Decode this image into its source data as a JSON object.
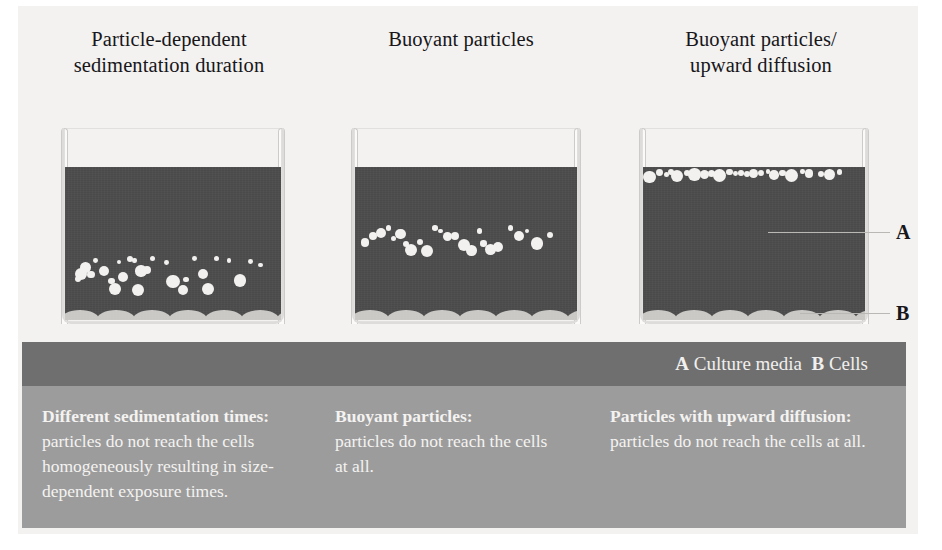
{
  "figure": {
    "background_color": "#f3f2f0",
    "liquid_color": "#4a4a4a",
    "particle_color": "#f2f1ef",
    "cell_color": "#c9c8c5",
    "legend_band_color": "#6f6f6f",
    "caption_band_color": "#9c9c9c"
  },
  "columns": [
    {
      "id": "particle-dependent-sedimentation",
      "title_line1": "Particle-dependent",
      "title_line2": "sedimentation duration",
      "caption_lead": "Different sedimentation times:",
      "caption_body": "particles do not reach the cells homogeneously resulting in size-dependent exposure times."
    },
    {
      "id": "buoyant-particles",
      "title_line1": "Buoyant particles",
      "title_line2": "",
      "caption_lead": "Buoyant particles:",
      "caption_body": "particles do not reach the cells at all."
    },
    {
      "id": "buoyant-particles-upward-diffusion",
      "title_line1": "Buoyant particles/",
      "title_line2": "upward diffusion",
      "caption_lead": "Particles with upward diffusion:",
      "caption_body": "particles do not reach the cells at all."
    }
  ],
  "legend": {
    "a_key": "A",
    "a_text": "Culture media",
    "b_key": "B",
    "b_text": "Cells"
  },
  "callouts": {
    "a_label": "A",
    "b_label": "B"
  },
  "diagram_data": {
    "type": "diagram",
    "description": "Three schematic culture-well cross sections illustrating nanoparticle dosimetry scenarios in which particles fail to reach the cell monolayer.",
    "beakers": [
      {
        "id": "particle-dependent-sedimentation",
        "liquid_fill_fraction": 0.78,
        "particle_distribution": "settling-gradient-toward-bottom",
        "particles": [
          {
            "cx": 0.062,
            "cy": 0.735,
            "r": 3.0
          },
          {
            "cx": 0.095,
            "cy": 0.655,
            "r": 5.4
          },
          {
            "cx": 0.12,
            "cy": 0.7,
            "r": 3.6
          },
          {
            "cx": 0.075,
            "cy": 0.698,
            "r": 6.2
          },
          {
            "cx": 0.14,
            "cy": 0.61,
            "r": 2.4
          },
          {
            "cx": 0.18,
            "cy": 0.68,
            "r": 5.0
          },
          {
            "cx": 0.215,
            "cy": 0.745,
            "r": 3.4
          },
          {
            "cx": 0.25,
            "cy": 0.62,
            "r": 2.2
          },
          {
            "cx": 0.268,
            "cy": 0.718,
            "r": 5.2
          },
          {
            "cx": 0.3,
            "cy": 0.602,
            "r": 3.0
          },
          {
            "cx": 0.322,
            "cy": 0.612,
            "r": 2.2
          },
          {
            "cx": 0.352,
            "cy": 0.68,
            "r": 5.6
          },
          {
            "cx": 0.38,
            "cy": 0.672,
            "r": 4.0
          },
          {
            "cx": 0.405,
            "cy": 0.6,
            "r": 2.6
          },
          {
            "cx": 0.47,
            "cy": 0.622,
            "r": 2.4
          },
          {
            "cx": 0.5,
            "cy": 0.748,
            "r": 6.6
          },
          {
            "cx": 0.56,
            "cy": 0.735,
            "r": 2.6
          },
          {
            "cx": 0.6,
            "cy": 0.598,
            "r": 2.4
          },
          {
            "cx": 0.64,
            "cy": 0.7,
            "r": 5.2
          },
          {
            "cx": 0.7,
            "cy": 0.598,
            "r": 2.6
          },
          {
            "cx": 0.76,
            "cy": 0.612,
            "r": 2.2
          },
          {
            "cx": 0.81,
            "cy": 0.74,
            "r": 6.4
          },
          {
            "cx": 0.86,
            "cy": 0.618,
            "r": 2.4
          },
          {
            "cx": 0.232,
            "cy": 0.8,
            "r": 6.0
          },
          {
            "cx": 0.34,
            "cy": 0.805,
            "r": 6.0
          },
          {
            "cx": 0.545,
            "cy": 0.805,
            "r": 5.0
          },
          {
            "cx": 0.66,
            "cy": 0.8,
            "r": 6.0
          },
          {
            "cx": 0.905,
            "cy": 0.64,
            "r": 2.4
          }
        ]
      },
      {
        "id": "buoyant-particles",
        "liquid_fill_fraction": 0.78,
        "particle_distribution": "mid-band-wave",
        "particles": [
          {
            "cx": 0.045,
            "cy": 0.495,
            "r": 4.4
          },
          {
            "cx": 0.082,
            "cy": 0.452,
            "r": 4.2
          },
          {
            "cx": 0.118,
            "cy": 0.432,
            "r": 5.0
          },
          {
            "cx": 0.15,
            "cy": 0.398,
            "r": 2.6
          },
          {
            "cx": 0.175,
            "cy": 0.468,
            "r": 2.6
          },
          {
            "cx": 0.205,
            "cy": 0.438,
            "r": 5.2
          },
          {
            "cx": 0.228,
            "cy": 0.5,
            "r": 3.0
          },
          {
            "cx": 0.25,
            "cy": 0.54,
            "r": 6.0
          },
          {
            "cx": 0.292,
            "cy": 0.49,
            "r": 3.2
          },
          {
            "cx": 0.325,
            "cy": 0.548,
            "r": 6.2
          },
          {
            "cx": 0.36,
            "cy": 0.4,
            "r": 2.8
          },
          {
            "cx": 0.385,
            "cy": 0.418,
            "r": 2.4
          },
          {
            "cx": 0.415,
            "cy": 0.452,
            "r": 4.6
          },
          {
            "cx": 0.45,
            "cy": 0.452,
            "r": 4.0
          },
          {
            "cx": 0.49,
            "cy": 0.508,
            "r": 6.0
          },
          {
            "cx": 0.525,
            "cy": 0.545,
            "r": 5.2
          },
          {
            "cx": 0.56,
            "cy": 0.418,
            "r": 2.8
          },
          {
            "cx": 0.578,
            "cy": 0.5,
            "r": 3.2
          },
          {
            "cx": 0.61,
            "cy": 0.54,
            "r": 5.4
          },
          {
            "cx": 0.645,
            "cy": 0.525,
            "r": 5.0
          },
          {
            "cx": 0.7,
            "cy": 0.398,
            "r": 2.8
          },
          {
            "cx": 0.74,
            "cy": 0.452,
            "r": 5.2
          },
          {
            "cx": 0.775,
            "cy": 0.418,
            "r": 2.4
          },
          {
            "cx": 0.82,
            "cy": 0.498,
            "r": 6.4
          },
          {
            "cx": 0.88,
            "cy": 0.445,
            "r": 3.0
          }
        ]
      },
      {
        "id": "buoyant-particles-upward-diffusion",
        "liquid_fill_fraction": 0.78,
        "particle_distribution": "surface-accumulated-band",
        "particles": [
          {
            "cx": 0.03,
            "cy": 0.065,
            "r": 6.4
          },
          {
            "cx": 0.075,
            "cy": 0.035,
            "r": 3.4
          },
          {
            "cx": 0.105,
            "cy": 0.05,
            "r": 2.6
          },
          {
            "cx": 0.128,
            "cy": 0.032,
            "r": 3.0
          },
          {
            "cx": 0.152,
            "cy": 0.06,
            "r": 6.0
          },
          {
            "cx": 0.2,
            "cy": 0.04,
            "r": 3.0
          },
          {
            "cx": 0.232,
            "cy": 0.048,
            "r": 6.2
          },
          {
            "cx": 0.278,
            "cy": 0.046,
            "r": 4.6
          },
          {
            "cx": 0.31,
            "cy": 0.04,
            "r": 3.6
          },
          {
            "cx": 0.345,
            "cy": 0.055,
            "r": 6.8
          },
          {
            "cx": 0.39,
            "cy": 0.032,
            "r": 3.4
          },
          {
            "cx": 0.418,
            "cy": 0.04,
            "r": 2.4
          },
          {
            "cx": 0.442,
            "cy": 0.038,
            "r": 2.8
          },
          {
            "cx": 0.468,
            "cy": 0.042,
            "r": 3.0
          },
          {
            "cx": 0.498,
            "cy": 0.044,
            "r": 4.4
          },
          {
            "cx": 0.532,
            "cy": 0.038,
            "r": 3.0
          },
          {
            "cx": 0.562,
            "cy": 0.03,
            "r": 2.2
          },
          {
            "cx": 0.59,
            "cy": 0.05,
            "r": 4.8
          },
          {
            "cx": 0.628,
            "cy": 0.038,
            "r": 3.2
          },
          {
            "cx": 0.668,
            "cy": 0.055,
            "r": 6.6
          },
          {
            "cx": 0.718,
            "cy": 0.028,
            "r": 2.2
          },
          {
            "cx": 0.748,
            "cy": 0.042,
            "r": 4.4
          },
          {
            "cx": 0.8,
            "cy": 0.044,
            "r": 3.0
          },
          {
            "cx": 0.84,
            "cy": 0.05,
            "r": 5.4
          },
          {
            "cx": 0.885,
            "cy": 0.032,
            "r": 2.6
          }
        ]
      }
    ]
  }
}
